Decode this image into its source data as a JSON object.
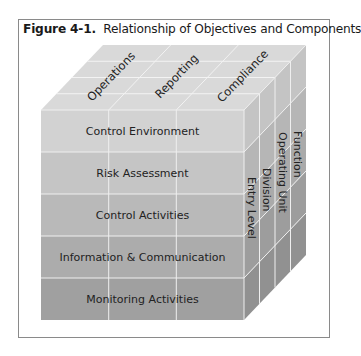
{
  "figure": {
    "number": "Figure 4-1.",
    "caption": "Relationship of Objectives and Components"
  },
  "cube": {
    "objectives": [
      "Operations",
      "Reporting",
      "Compliance"
    ],
    "components": [
      "Control Environment",
      "Risk Assessment",
      "Control Activities",
      "Information & Communication",
      "Monitoring Activities"
    ],
    "entity_levels": [
      "Entry Level",
      "Division",
      "Operating Unit",
      "Function"
    ],
    "colors": {
      "top": "#d9d9d9",
      "row_shades": [
        "#d2d2d2",
        "#c5c5c5",
        "#b9b9b9",
        "#acacac",
        "#a0a0a0"
      ],
      "side_shades": [
        "#c4c4c4",
        "#b6b6b6",
        "#aaaaaa",
        "#9d9d9d",
        "#919191"
      ],
      "grid": "#f2f2f2"
    }
  }
}
